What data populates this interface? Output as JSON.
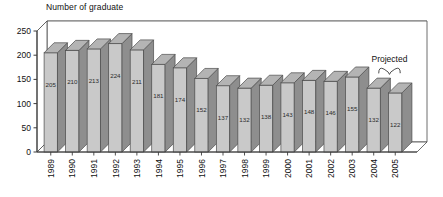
{
  "chart_data": {
    "type": "bar",
    "title": "Number of graduate",
    "xlabel": "",
    "ylabel": "",
    "ylim": [
      0,
      250
    ],
    "yticks": [
      0,
      50,
      100,
      150,
      200,
      250
    ],
    "grid": true,
    "legend": "none",
    "style": "3d-column",
    "categories": [
      "1989",
      "1990",
      "1991",
      "1992",
      "1993",
      "1994",
      "1995",
      "1996",
      "1997",
      "1998",
      "1999",
      "2000",
      "2001",
      "2002",
      "2003",
      "2004",
      "2005"
    ],
    "values": [
      205,
      210,
      213,
      224,
      211,
      181,
      174,
      152,
      137,
      132,
      138,
      143,
      148,
      146,
      155,
      132,
      122
    ],
    "data_labels": [
      "205",
      "210",
      "213",
      "224",
      "211",
      "181",
      "174",
      "152",
      "137",
      "132",
      "138",
      "143",
      "148",
      "146",
      "155",
      "132",
      "122"
    ],
    "annotations": [
      {
        "text": "Projected",
        "covers": [
          "2004",
          "2005"
        ],
        "style": "curly-brace"
      }
    ],
    "colors": {
      "bar_front": "#c9c9c9",
      "bar_side": "#8e8e8e",
      "bar_top": "#b4b4b4",
      "outline": "#4a4a4a",
      "gridline": "#7a7a7a",
      "axis": "#3c3c3c",
      "background": "#ffffff",
      "text": "#111111"
    }
  }
}
